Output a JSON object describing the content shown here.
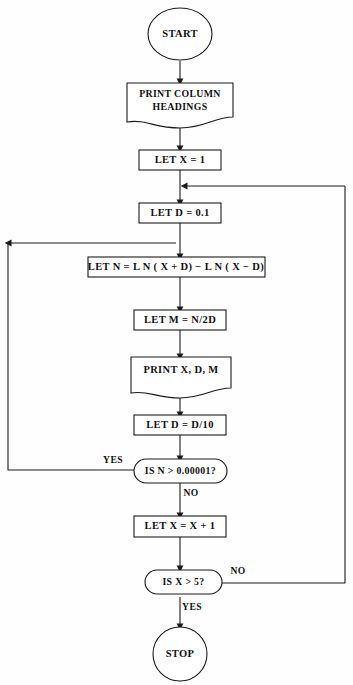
{
  "diagram": {
    "orientation": "top-to-bottom",
    "background_color": "#ffffff",
    "line_color": "#1a1a1a",
    "text_color": "#111111"
  },
  "nodes": {
    "start": {
      "label": "START",
      "shape": "oval-terminator"
    },
    "print_headings": {
      "label_line1": "PRINT COLUMN",
      "label_line2": "HEADINGS",
      "shape": "document-output"
    },
    "let_x_1": {
      "label": "LET X = 1",
      "shape": "process-rectangle"
    },
    "let_d_01": {
      "label": "LET D = 0.1",
      "shape": "process-rectangle"
    },
    "let_n": {
      "label": "LET N = L N ( X + D)  −  L N ( X − D)",
      "shape": "process-rectangle"
    },
    "let_m": {
      "label": "LET M = N/2D",
      "shape": "process-rectangle"
    },
    "print_xdm": {
      "label": "PRINT X, D, M",
      "shape": "document-output"
    },
    "let_d_div10": {
      "label": "LET D = D/10",
      "shape": "process-rectangle"
    },
    "decision_n": {
      "label": "IS N > 0.00001?",
      "shape": "rounded-decision"
    },
    "let_x_inc": {
      "label": "LET X = X + 1",
      "shape": "process-rectangle"
    },
    "decision_x": {
      "label": "IS X > 5?",
      "shape": "rounded-decision"
    },
    "stop": {
      "label": "STOP",
      "shape": "circle-terminator"
    }
  },
  "branch_labels": {
    "decision_n_yes": "YES",
    "decision_n_no": "NO",
    "decision_x_no": "NO",
    "decision_x_yes": "YES"
  },
  "edges": [
    {
      "from": "start",
      "to": "print_headings",
      "label": ""
    },
    {
      "from": "print_headings",
      "to": "let_x_1",
      "label": ""
    },
    {
      "from": "let_x_1",
      "to": "let_d_01",
      "label": ""
    },
    {
      "from": "let_d_01",
      "to": "let_n",
      "label": ""
    },
    {
      "from": "let_n",
      "to": "let_m",
      "label": ""
    },
    {
      "from": "let_m",
      "to": "print_xdm",
      "label": ""
    },
    {
      "from": "print_xdm",
      "to": "let_d_div10",
      "label": ""
    },
    {
      "from": "let_d_div10",
      "to": "decision_n",
      "label": ""
    },
    {
      "from": "decision_n",
      "to": "let_n",
      "label": "YES"
    },
    {
      "from": "decision_n",
      "to": "let_x_inc",
      "label": "NO"
    },
    {
      "from": "let_x_inc",
      "to": "decision_x",
      "label": ""
    },
    {
      "from": "decision_x",
      "to": "let_d_01",
      "label": "NO"
    },
    {
      "from": "decision_x",
      "to": "stop",
      "label": "YES"
    }
  ]
}
